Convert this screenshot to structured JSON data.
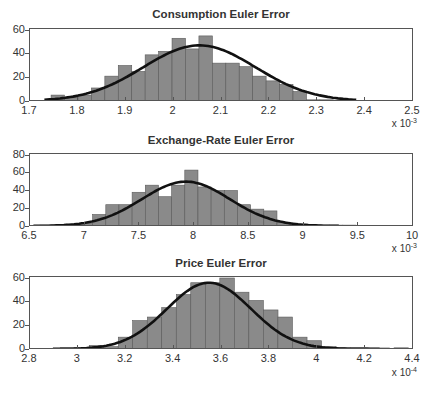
{
  "figure": {
    "panels": [
      {
        "title": "Consumption Euler Error",
        "exponent_label": "x 10",
        "exponent_power": "-3"
      },
      {
        "title": "Exchange-Rate Euler Error",
        "exponent_label": "x 10",
        "exponent_power": "-3"
      },
      {
        "title": "Price Euler Error",
        "exponent_label": "x 10",
        "exponent_power": "-4"
      }
    ]
  },
  "colors": {
    "bar_fill": "#8a8a8a",
    "bar_edge": "#5a5a5a",
    "curve": "#111111",
    "axis": "#555555"
  },
  "chart_data": [
    {
      "type": "bar",
      "title": "Consumption Euler Error",
      "xlabel": "",
      "ylabel": "",
      "x_scale_note": "x 10^-3",
      "xlim": [
        1.7,
        2.5
      ],
      "ylim": [
        0,
        60
      ],
      "xticks": [
        "1.7",
        "1.8",
        "1.9",
        "2",
        "2.1",
        "2.2",
        "2.3",
        "2.4",
        "2.5"
      ],
      "yticks": [
        "0",
        "20",
        "40",
        "60"
      ],
      "bin_width": 0.028,
      "bin_left_edges": [
        1.746,
        1.774,
        1.802,
        1.83,
        1.858,
        1.886,
        1.914,
        1.942,
        1.97,
        1.998,
        2.026,
        2.054,
        2.082,
        2.11,
        2.138,
        2.166,
        2.194,
        2.222,
        2.25,
        2.278,
        2.306,
        2.334,
        2.362,
        2.39
      ],
      "values": [
        5,
        3,
        5,
        11,
        21,
        30,
        25,
        39,
        42,
        53,
        44,
        55,
        32,
        32,
        29,
        21,
        17,
        14,
        8,
        1,
        1,
        0.5,
        0.3,
        0.5
      ],
      "fit_curve": {
        "type": "normal",
        "mean": 2.055,
        "sd": 0.117,
        "peak": 47
      }
    },
    {
      "type": "bar",
      "title": "Exchange-Rate Euler Error",
      "xlabel": "",
      "ylabel": "",
      "x_scale_note": "x 10^-3",
      "xlim": [
        6.5,
        10
      ],
      "ylim": [
        0,
        80
      ],
      "xticks": [
        "6.5",
        "7",
        "7.5",
        "8",
        "8.5",
        "9",
        "9.5",
        "10"
      ],
      "yticks": [
        "0",
        "20",
        "40",
        "60",
        "80"
      ],
      "bin_width": 0.12,
      "bin_left_edges": [
        6.6,
        6.72,
        6.84,
        6.96,
        7.08,
        7.2,
        7.32,
        7.44,
        7.56,
        7.68,
        7.8,
        7.92,
        8.04,
        8.16,
        8.28,
        8.4,
        8.52,
        8.64,
        8.76,
        8.88,
        9.0,
        9.12,
        9.24,
        9.36
      ],
      "values": [
        1,
        1,
        2,
        3,
        13,
        24,
        24,
        38,
        46,
        33,
        46,
        63,
        44,
        40,
        40,
        24,
        19,
        17,
        4,
        1,
        1,
        1,
        1,
        1
      ],
      "fit_curve": {
        "type": "normal",
        "mean": 7.93,
        "sd": 0.4,
        "peak": 50
      }
    },
    {
      "type": "bar",
      "title": "Price Euler Error",
      "xlabel": "",
      "ylabel": "",
      "x_scale_note": "x 10^-4",
      "xlim": [
        2.8,
        4.4
      ],
      "ylim": [
        0,
        60
      ],
      "xticks": [
        "2.8",
        "3",
        "3.2",
        "3.4",
        "3.6",
        "3.8",
        "4",
        "4.2",
        "4.4"
      ],
      "yticks": [
        "0",
        "20",
        "40",
        "60"
      ],
      "bin_width": 0.0605,
      "bin_left_edges": [
        2.93,
        2.99,
        3.051,
        3.111,
        3.172,
        3.232,
        3.293,
        3.353,
        3.414,
        3.474,
        3.535,
        3.595,
        3.656,
        3.716,
        3.777,
        3.837,
        3.898,
        3.958,
        4.019,
        4.079,
        4.14,
        4.2,
        4.261,
        4.321
      ],
      "values": [
        1,
        1,
        3,
        2,
        10,
        24,
        27,
        35,
        46,
        56,
        56,
        60,
        48,
        41,
        33,
        27,
        10,
        7,
        2,
        1,
        1,
        1,
        0,
        1
      ],
      "fit_curve": {
        "type": "normal",
        "mean": 3.55,
        "sd": 0.175,
        "peak": 56
      }
    }
  ]
}
